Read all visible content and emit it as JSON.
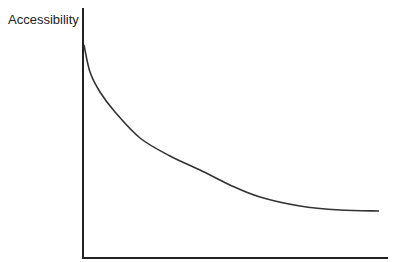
{
  "chart_data": {
    "type": "line",
    "title": "",
    "xlabel": "",
    "ylabel": "Accessibility",
    "grid": false,
    "legend": null,
    "ticks": {
      "x": [],
      "y": []
    },
    "series": [
      {
        "name": "Accessibility",
        "description": "Monotonically decreasing convex curve (distance-decay shape), steep near the origin and flattening toward the right",
        "points_px": [
          [
            84,
            45
          ],
          [
            90,
            72
          ],
          [
            100,
            92
          ],
          [
            115,
            112
          ],
          [
            140,
            138
          ],
          [
            170,
            156
          ],
          [
            200,
            170
          ],
          [
            230,
            185
          ],
          [
            260,
            197
          ],
          [
            300,
            206
          ],
          [
            340,
            210
          ],
          [
            379,
            211
          ]
        ]
      }
    ],
    "axes": {
      "x_axis": {
        "y": 258,
        "x_start": 83,
        "x_end": 388
      },
      "y_axis": {
        "x": 83,
        "y_start": 8,
        "y_end": 258
      }
    },
    "colors": {
      "axis": "#222222",
      "line": "#333333"
    }
  },
  "labels": {
    "y_axis": "Accessibility"
  }
}
